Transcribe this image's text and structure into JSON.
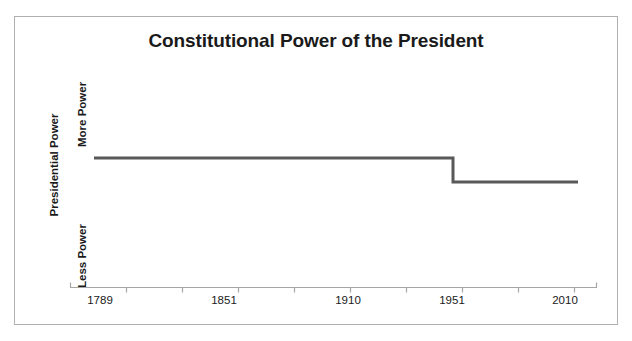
{
  "figure": {
    "background_color": "#ffffff",
    "border_color": "#b0b0b0"
  },
  "chart_data": {
    "type": "line",
    "title": "Constitutional Power of the President",
    "xlabel": "",
    "ylabel": "Presidential Power",
    "grid": false,
    "legend": false,
    "line_color": "#595959",
    "line_width": 3,
    "axis_color": "#a6a6a6",
    "x_tick_labels": [
      "1789",
      "1851",
      "1910",
      "1951",
      "2010"
    ],
    "x_tick_positions_px": [
      100,
      224,
      348,
      452,
      565
    ],
    "y_tick_labels": [
      "More Power",
      "Less Power"
    ],
    "ylim_labels": [
      "Less Power",
      "More Power"
    ],
    "annotation": "Step decrease in presidential power at 1951",
    "series": [
      {
        "name": "Presidential Power",
        "step": "post",
        "points": [
          {
            "x": "1789",
            "y": "More Power",
            "y_px": 158,
            "x_px": 94
          },
          {
            "x": "1951",
            "y": "More Power",
            "y_px": 158,
            "x_px": 453
          },
          {
            "x": "1951",
            "y": "Less than More Power",
            "y_px": 182,
            "x_px": 453
          },
          {
            "x": "2010",
            "y": "Less than More Power",
            "y_px": 182,
            "x_px": 578
          }
        ]
      }
    ]
  },
  "axis": {
    "x_axis_line": {
      "y_px": 287,
      "x_start_px": 70,
      "x_end_px": 597,
      "tick_spacing_px": 56,
      "tick_count": 10
    }
  }
}
